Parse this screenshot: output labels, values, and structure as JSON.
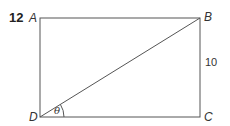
{
  "question": {
    "number": "12"
  },
  "figure": {
    "shape": "rectangle",
    "vertices": {
      "A": "A",
      "B": "B",
      "C": "C",
      "D": "D"
    },
    "diagonal": "DB",
    "side_labels": {
      "BC": "10"
    },
    "angle": {
      "vertex": "D",
      "symbol": "θ",
      "between": [
        "DC",
        "DB"
      ]
    },
    "colors": {
      "line": "#555555",
      "text": "#333333"
    }
  }
}
